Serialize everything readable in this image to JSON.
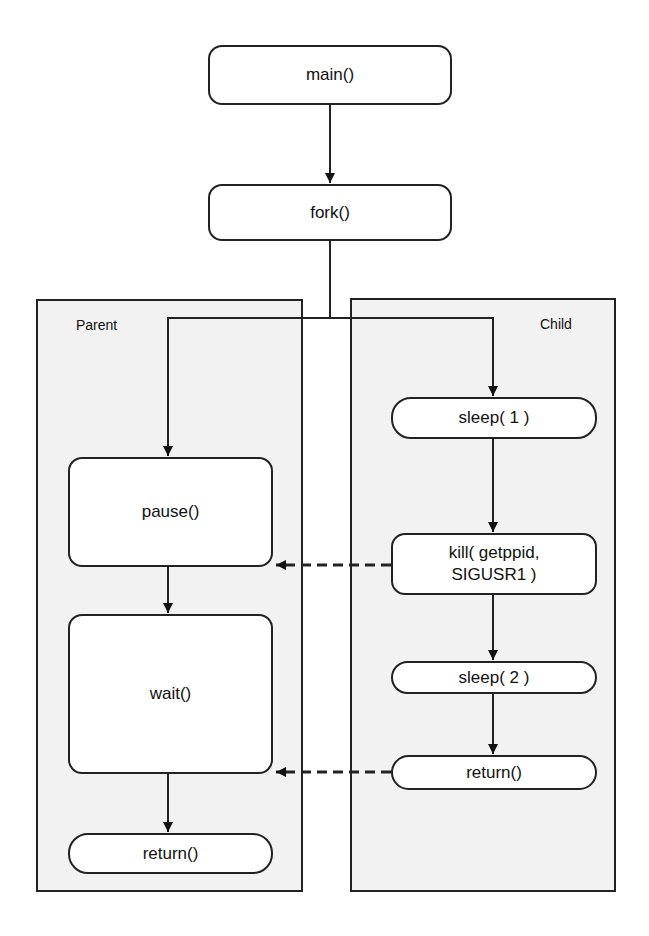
{
  "diagram": {
    "nodes": {
      "main": "main()",
      "fork": "fork()",
      "parent_pause": "pause()",
      "parent_wait": "wait()",
      "parent_return": "return()",
      "child_sleep1": "sleep( 1 )",
      "child_kill_line1": "kill( getppid,",
      "child_kill_line2": "SIGUSR1 )",
      "child_sleep2": "sleep( 2 )",
      "child_return": "return()"
    },
    "panels": {
      "parent": "Parent",
      "child": "Child"
    },
    "edges": [
      {
        "from": "main",
        "to": "fork",
        "style": "solid"
      },
      {
        "from": "fork",
        "to": "parent_pause",
        "style": "solid"
      },
      {
        "from": "fork",
        "to": "child_sleep1",
        "style": "solid"
      },
      {
        "from": "parent_pause",
        "to": "parent_wait",
        "style": "solid"
      },
      {
        "from": "parent_wait",
        "to": "parent_return",
        "style": "solid"
      },
      {
        "from": "child_sleep1",
        "to": "child_kill",
        "style": "solid"
      },
      {
        "from": "child_kill",
        "to": "child_sleep2",
        "style": "solid"
      },
      {
        "from": "child_sleep2",
        "to": "child_return",
        "style": "solid"
      },
      {
        "from": "child_kill",
        "to": "parent_pause",
        "style": "dashed",
        "meaning": "signal"
      },
      {
        "from": "child_return",
        "to": "parent_wait",
        "style": "dashed",
        "meaning": "exit"
      }
    ],
    "colors": {
      "panel_fill": "#f2f2f2",
      "node_fill": "#ffffff",
      "stroke": "#222222"
    }
  }
}
